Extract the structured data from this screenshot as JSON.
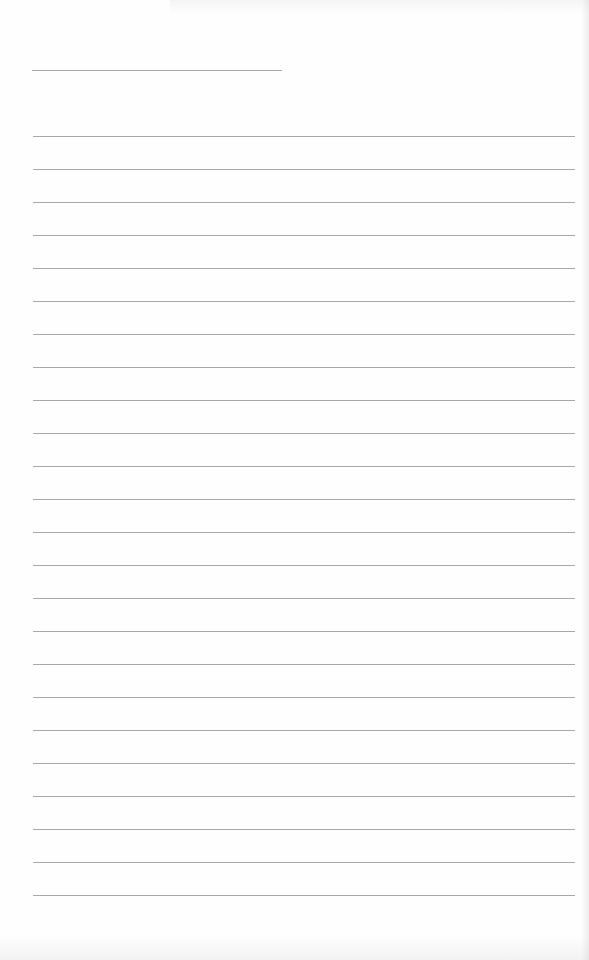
{
  "page": {
    "type": "lined-notebook-page",
    "background_color": "#fefefe",
    "line_color": "#a8a8a8",
    "date_line": {
      "x": 32,
      "y": 70,
      "width": 250
    },
    "rules": {
      "count": 24,
      "first_y": 136,
      "spacing": 33,
      "x": 33,
      "width": 542
    },
    "text_content": []
  }
}
